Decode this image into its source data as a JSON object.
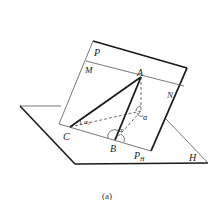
{
  "figure": {
    "caption": "(a)",
    "colors": {
      "stroke": "#1a1a1a",
      "thin": "#555555",
      "background": "#ffffff"
    }
  },
  "planes": {
    "P": {
      "label": "P"
    },
    "H": {
      "label": "H"
    }
  },
  "lines": {
    "M": {
      "label": "M"
    },
    "N": {
      "label": "N"
    },
    "PH": {
      "label": "P",
      "subscript": "H"
    }
  },
  "points": {
    "A": {
      "label": "A"
    },
    "B": {
      "label": "B"
    },
    "C": {
      "label": "C"
    }
  },
  "angles": {
    "alpha": {
      "label": "α"
    },
    "alpha1": {
      "label": "α",
      "subscript": "1"
    },
    "theta": {
      "label": "α"
    }
  }
}
